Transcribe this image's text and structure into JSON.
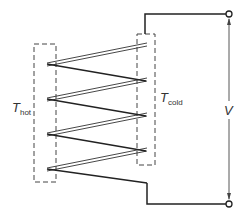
{
  "diagram": {
    "type": "thermocouple / thermopile schematic",
    "colors": {
      "line": "#333333",
      "background": "#ffffff"
    },
    "labels": {
      "hot": {
        "main": "T",
        "sub": "hot"
      },
      "cold": {
        "main": "T",
        "sub": "cold"
      },
      "voltage": "V"
    },
    "junctions": {
      "hot_count": 4,
      "cold_count": 4
    },
    "terminals": [
      "top-terminal",
      "bottom-terminal"
    ]
  }
}
